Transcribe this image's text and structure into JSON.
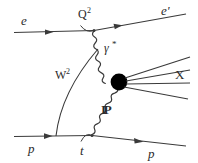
{
  "figure": {
    "kind": "feynman-diagram",
    "topic": "diffractive deep inelastic scattering",
    "background_color": "#ffffff",
    "line_color": "#3a3a3a",
    "blob_color": "#000000"
  },
  "labels": {
    "incoming_electron": "e",
    "outgoing_electron": "e'",
    "virtual_photon": "γ",
    "virtual_photon_star": "*",
    "photon_virtuality": "Q",
    "photon_virtuality_exp": "2",
    "hadronic_mass": "W",
    "hadronic_mass_exp": "2",
    "pomeron": "IP",
    "momentum_transfer": "t",
    "diffractive_system": "X",
    "incoming_proton": "p",
    "outgoing_proton": "p"
  },
  "elements": {
    "electron_in_line": "incoming-electron-line",
    "electron_out_line": "outgoing-electron-line",
    "photon_wavy_line": "virtual-photon-propagator",
    "pomeron_wavy_line": "pomeron-propagator",
    "proton_in_line": "incoming-proton-line",
    "proton_out_line": "outgoing-proton-line",
    "hadronic_blob": "hadronic-interaction-blob",
    "x_system_jets": [
      "jet-line-1",
      "jet-line-2",
      "jet-line-3",
      "jet-line-4"
    ],
    "w_arc": "w-squared-arc",
    "q_arc": "q-squared-vertex-arc",
    "t_arc": "t-vertex-arc"
  }
}
